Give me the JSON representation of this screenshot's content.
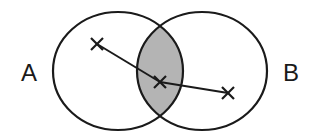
{
  "diagram": {
    "type": "venn",
    "sets": [
      {
        "label": "A",
        "cx": 118,
        "cy": 71,
        "rx": 65,
        "ry": 59
      },
      {
        "label": "B",
        "cx": 202,
        "cy": 71,
        "rx": 65,
        "ry": 59
      }
    ],
    "intersection_fill": "#b4b4b4",
    "stroke_color": "#1a1a1a",
    "points": [
      {
        "marker": "x",
        "x": 97,
        "y": 44,
        "region": "A only"
      },
      {
        "marker": "x",
        "x": 160,
        "y": 82,
        "region": "A and B"
      },
      {
        "marker": "x",
        "x": 228,
        "y": 93,
        "region": "B only"
      }
    ],
    "connections": [
      [
        0,
        1
      ],
      [
        1,
        2
      ]
    ],
    "label_a": "A",
    "label_b": "B"
  }
}
